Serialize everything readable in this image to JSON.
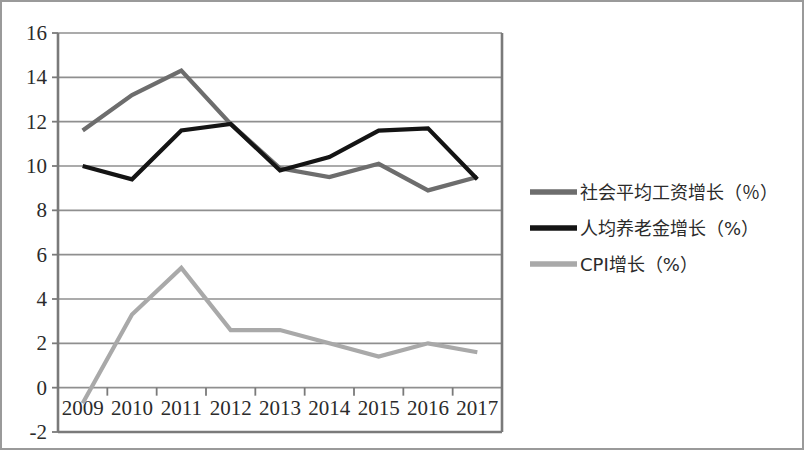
{
  "chart_data": {
    "type": "line",
    "title": "",
    "subtitle": "",
    "xlabel": "",
    "ylabel": "",
    "x": [
      "2009",
      "2010",
      "2011",
      "2012",
      "2013",
      "2014",
      "2015",
      "2016",
      "2017"
    ],
    "categories": [
      "2009",
      "2010",
      "2011",
      "2012",
      "2013",
      "2014",
      "2015",
      "2016",
      "2017"
    ],
    "ylim": [
      -2,
      16
    ],
    "ytick_labels": [
      "16",
      "14",
      "12",
      "10",
      "8",
      "6",
      "4",
      "2",
      "0",
      "-2"
    ],
    "ytick_values": [
      16,
      14,
      12,
      10,
      8,
      6,
      4,
      2,
      0,
      -2
    ],
    "ystep": 2,
    "grid": true,
    "grid_axis": "y",
    "legend_position": "right",
    "series": [
      {
        "name": "社会平均工资增长（％）",
        "color": "#6d6d6d",
        "values": [
          11.6,
          13.2,
          14.3,
          11.9,
          9.9,
          9.5,
          10.1,
          8.9,
          9.5
        ]
      },
      {
        "name": "人均养老金增长（%）",
        "color": "#141414",
        "values": [
          10.0,
          9.4,
          11.6,
          11.9,
          9.8,
          10.4,
          11.6,
          11.7,
          9.4
        ]
      },
      {
        "name": "CPI增长（%）",
        "color": "#a9a9a9",
        "values": [
          -0.7,
          3.3,
          5.4,
          2.6,
          2.6,
          2.0,
          1.4,
          2.0,
          1.6
        ]
      }
    ]
  },
  "legend": {
    "items": [
      {
        "label": "社会平均工资增长（％）",
        "color": "#6d6d6d"
      },
      {
        "label": "人均养老金增长（%）",
        "color": "#141414"
      },
      {
        "label": "CPI增长（%）",
        "color": "#a9a9a9"
      }
    ]
  },
  "axes": {
    "y_labels": [
      "16",
      "14",
      "12",
      "10",
      "8",
      "6",
      "4",
      "2",
      "0",
      "-2"
    ],
    "x_labels": [
      "2009",
      "2010",
      "2011",
      "2012",
      "2013",
      "2014",
      "2015",
      "2016",
      "2017"
    ]
  },
  "colors": {
    "frame": "#9a9a9a",
    "grid": "#8f8f8f",
    "axis": "#7a7a7a",
    "text": "#2b2b2b",
    "background": "#ffffff"
  }
}
